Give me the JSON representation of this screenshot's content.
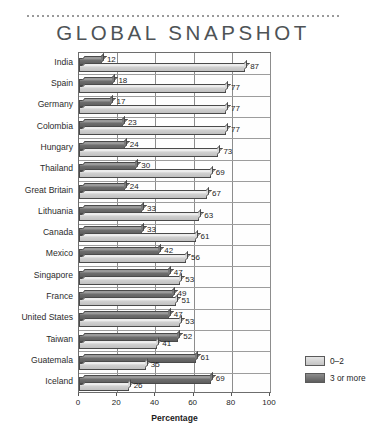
{
  "header": {
    "title": "GLOBAL SNAPSHOT"
  },
  "legend": {
    "items": [
      {
        "label": "0–2",
        "key": "light"
      },
      {
        "label": "3 or more",
        "key": "dark"
      }
    ]
  },
  "axis": {
    "xlabel": "Percentage",
    "ticks": [
      "0",
      "20",
      "40",
      "60",
      "80",
      "100"
    ]
  },
  "chart_data": {
    "type": "bar",
    "orientation": "horizontal",
    "title": "GLOBAL SNAPSHOT",
    "xlabel": "Percentage",
    "ylabel": "",
    "xlim": [
      0,
      100
    ],
    "xticks": [
      0,
      20,
      40,
      60,
      80,
      100
    ],
    "grid": "vertical",
    "legend_position": "right",
    "categories": [
      "India",
      "Spain",
      "Germany",
      "Colombia",
      "Hungary",
      "Thailand",
      "Great Britain",
      "Lithuania",
      "Canada",
      "Mexico",
      "Singapore",
      "France",
      "United States",
      "Taiwan",
      "Guatemala",
      "Iceland"
    ],
    "series": [
      {
        "name": "3 or more",
        "color": "#6d6d6d",
        "values": [
          12,
          18,
          17,
          23,
          24,
          30,
          24,
          33,
          33,
          42,
          47,
          49,
          47,
          52,
          61,
          69
        ]
      },
      {
        "name": "0–2",
        "color": "#cfcfcf",
        "values": [
          87,
          77,
          77,
          77,
          73,
          69,
          67,
          63,
          61,
          56,
          53,
          51,
          53,
          41,
          35,
          26
        ]
      }
    ]
  }
}
